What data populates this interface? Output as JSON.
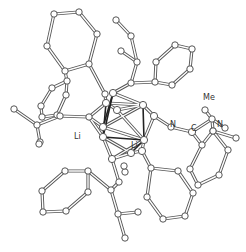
{
  "figure": {
    "type": "crystal-structure-ball-and-stick",
    "labels": {
      "li_left": "Li",
      "li_center": "Li",
      "n_right": "N",
      "n_far": "N",
      "c_label": "C",
      "me_label": "Me"
    },
    "colors": {
      "bond_outline": "#555555",
      "li_li_bond": "#222222",
      "atom_fill": "#ffffff",
      "label": "#333333"
    }
  }
}
